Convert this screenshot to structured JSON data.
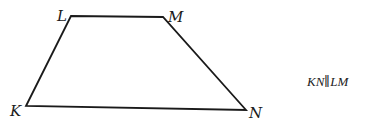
{
  "figure": {
    "type": "trapezoid",
    "stroke_color": "#1a1a1a",
    "vertices": {
      "K": {
        "label": "K",
        "x": 26,
        "y": 106
      },
      "L": {
        "label": "L",
        "x": 71,
        "y": 16
      },
      "M": {
        "label": "M",
        "x": 163,
        "y": 17
      },
      "N": {
        "label": "N",
        "x": 246,
        "y": 110
      }
    }
  },
  "annotation": {
    "relation": "KN∥LM"
  }
}
